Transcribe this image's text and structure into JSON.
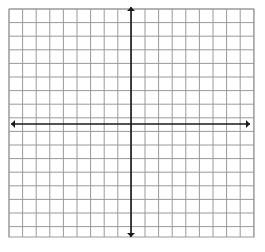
{
  "graph": {
    "title": "",
    "description": "blank coordinate grid with x and y axes",
    "background_color": "#ffffff",
    "grid": {
      "color": "#9a9a9a",
      "line_width": 1,
      "cell_size": 13.6,
      "left": 9,
      "top": 9,
      "right": 254,
      "bottom": 237,
      "columns": 18,
      "rows": 17,
      "border_color": "#9a9a9a"
    },
    "axes": {
      "color": "#1a1a1a",
      "line_width": 1.6,
      "origin_x": 131,
      "origin_y": 124,
      "x_axis": {
        "name": "x-axis",
        "start_x": 11,
        "end_x": 250,
        "y": 124,
        "arrow_left": true,
        "arrow_right": true
      },
      "y_axis": {
        "name": "y-axis",
        "start_y": 7,
        "end_y": 237,
        "x": 131,
        "arrow_up": true,
        "arrow_down": true
      },
      "arrow_size": 4
    },
    "labels": {
      "x_label": "",
      "y_label": "",
      "tick_labels": [],
      "origin_label": ""
    },
    "plotted_data": {
      "points": [],
      "lines": [],
      "curves": []
    }
  }
}
